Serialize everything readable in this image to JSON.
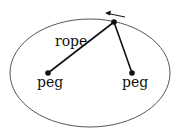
{
  "diagram": {
    "type": "ellipse-construction",
    "labels": {
      "rope": "rope",
      "peg_left": "peg",
      "peg_right": "peg"
    },
    "colors": {
      "stroke": "#111111",
      "ellipse": "#555555",
      "background": "#ffffff"
    }
  }
}
